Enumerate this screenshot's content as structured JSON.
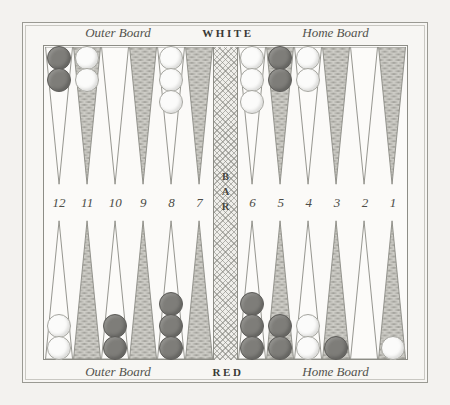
{
  "figure": {
    "name": "backgammon-board-diagram",
    "colors": {
      "paper": "#f7f6f3",
      "frame_line": "#9a9a93",
      "shaded_point": "#9e9d97",
      "light_point": "#fbfaf8",
      "white_checker": "#fbfbfa",
      "red_checker": "#7e7d79",
      "bar_hatch": "#80807a"
    }
  },
  "captions": {
    "top": {
      "outer_board": "Outer Board",
      "player": "WHITE",
      "home_board": "Home Board"
    },
    "bottom": {
      "outer_board": "Outer Board",
      "player": "RED",
      "home_board": "Home Board"
    }
  },
  "bar": {
    "label": "BAR",
    "letters": [
      "B",
      "A",
      "R"
    ]
  },
  "point_numbers": {
    "left": [
      "12",
      "11",
      "10",
      "9",
      "8",
      "7"
    ],
    "right": [
      "6",
      "5",
      "4",
      "3",
      "2",
      "1"
    ]
  },
  "chart_data": {
    "type": "table",
    "legend": [
      "WHITE checkers (light)",
      "RED checkers (dark)"
    ],
    "columns": [
      "point",
      "quadrant",
      "checker_color",
      "count"
    ],
    "top_row_points": [
      {
        "point": "12",
        "quadrant": "white-outer",
        "color": "red",
        "count": 2
      },
      {
        "point": "11",
        "quadrant": "white-outer",
        "color": "white",
        "count": 2
      },
      {
        "point": "10",
        "quadrant": "white-outer",
        "color": "none",
        "count": 0
      },
      {
        "point": "9",
        "quadrant": "white-outer",
        "color": "none",
        "count": 0
      },
      {
        "point": "8",
        "quadrant": "white-outer",
        "color": "white",
        "count": 3
      },
      {
        "point": "7",
        "quadrant": "white-outer",
        "color": "none",
        "count": 0
      },
      {
        "point": "6",
        "quadrant": "white-home",
        "color": "white",
        "count": 3
      },
      {
        "point": "5",
        "quadrant": "white-home",
        "color": "red",
        "count": 2
      },
      {
        "point": "4",
        "quadrant": "white-home",
        "color": "white",
        "count": 2
      },
      {
        "point": "3",
        "quadrant": "white-home",
        "color": "none",
        "count": 0
      },
      {
        "point": "2",
        "quadrant": "white-home",
        "color": "none",
        "count": 0
      },
      {
        "point": "1",
        "quadrant": "white-home",
        "color": "none",
        "count": 0
      }
    ],
    "bottom_row_points": [
      {
        "point": "12",
        "quadrant": "red-outer",
        "color": "white",
        "count": 2
      },
      {
        "point": "11",
        "quadrant": "red-outer",
        "color": "none",
        "count": 0
      },
      {
        "point": "10",
        "quadrant": "red-outer",
        "color": "red",
        "count": 2
      },
      {
        "point": "9",
        "quadrant": "red-outer",
        "color": "none",
        "count": 0
      },
      {
        "point": "8",
        "quadrant": "red-outer",
        "color": "red",
        "count": 3
      },
      {
        "point": "7",
        "quadrant": "red-outer",
        "color": "none",
        "count": 0
      },
      {
        "point": "6",
        "quadrant": "red-home",
        "color": "red",
        "count": 3
      },
      {
        "point": "5",
        "quadrant": "red-home",
        "color": "red",
        "count": 2
      },
      {
        "point": "4",
        "quadrant": "red-home",
        "color": "white",
        "count": 2
      },
      {
        "point": "3",
        "quadrant": "red-home",
        "color": "red",
        "count": 1
      },
      {
        "point": "2",
        "quadrant": "red-home",
        "color": "none",
        "count": 0
      },
      {
        "point": "1",
        "quadrant": "red-home",
        "color": "white",
        "count": 1
      }
    ],
    "shading_pattern": {
      "note": "Points alternate light / shaded; odd-numbered points are shaded.",
      "shaded_points": [
        "11",
        "9",
        "7",
        "5",
        "3",
        "1"
      ],
      "light_points": [
        "12",
        "10",
        "8",
        "6",
        "4",
        "2"
      ]
    }
  }
}
